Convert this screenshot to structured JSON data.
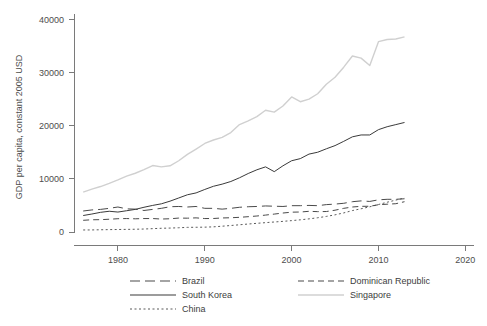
{
  "chart_data": {
    "type": "line",
    "title": "",
    "subtitle": "",
    "xlabel": "",
    "ylabel": "GDP per capita, constant 2005 USD",
    "xlim": [
      1975,
      2021
    ],
    "ylim": [
      0,
      41000
    ],
    "grid": false,
    "legend_position": "bottom",
    "xticks": [
      "1980",
      "1990",
      "2000",
      "2010",
      "2020"
    ],
    "xtick_values": [
      1980,
      1990,
      2000,
      2010,
      2020
    ],
    "yticks": [
      "0",
      "10000",
      "20000",
      "30000",
      "40000"
    ],
    "ytick_values": [
      0,
      10000,
      20000,
      30000,
      40000
    ],
    "x": [
      1976,
      1977,
      1978,
      1979,
      1980,
      1981,
      1982,
      1983,
      1984,
      1985,
      1986,
      1987,
      1988,
      1989,
      1990,
      1991,
      1992,
      1993,
      1994,
      1995,
      1996,
      1997,
      1998,
      1999,
      2000,
      2001,
      2002,
      2003,
      2004,
      2005,
      2006,
      2007,
      2008,
      2009,
      2010,
      2011,
      2012,
      2013
    ],
    "series": [
      {
        "name": "Brazil",
        "color": "#4a4a4a",
        "dash": "long-dash",
        "values": [
          3950,
          4150,
          4250,
          4450,
          4700,
          4350,
          4300,
          4050,
          4250,
          4450,
          4750,
          4800,
          4700,
          4800,
          4450,
          4450,
          4300,
          4450,
          4650,
          4750,
          4800,
          4900,
          4850,
          4800,
          4950,
          4950,
          5000,
          4950,
          5150,
          5250,
          5400,
          5700,
          5850,
          5750,
          6050,
          6150,
          6150,
          6250
        ]
      },
      {
        "name": "South Korea",
        "color": "#3a3a3a",
        "dash": "solid",
        "values": [
          3100,
          3380,
          3700,
          3900,
          3750,
          4000,
          4250,
          4650,
          5000,
          5300,
          5800,
          6400,
          7000,
          7350,
          8000,
          8600,
          9000,
          9500,
          10200,
          11000,
          11700,
          12250,
          11350,
          12450,
          13400,
          13800,
          14650,
          15000,
          15650,
          16250,
          17050,
          17900,
          18250,
          18250,
          19250,
          19800,
          20200,
          20600
        ]
      },
      {
        "name": "China",
        "color": "#5a5a5a",
        "dash": "dotted",
        "values": [
          380,
          390,
          420,
          450,
          470,
          490,
          520,
          560,
          630,
          700,
          740,
          800,
          870,
          890,
          910,
          970,
          1090,
          1220,
          1360,
          1500,
          1630,
          1760,
          1880,
          2000,
          2140,
          2290,
          2470,
          2680,
          2930,
          3230,
          3590,
          4030,
          4370,
          4740,
          5170,
          5600,
          6000,
          6400
        ]
      },
      {
        "name": "Dominican Republic",
        "color": "#4a4a4a",
        "dash": "dash",
        "values": [
          2200,
          2300,
          2320,
          2400,
          2500,
          2530,
          2480,
          2530,
          2530,
          2440,
          2490,
          2620,
          2600,
          2660,
          2530,
          2540,
          2640,
          2680,
          2760,
          2880,
          3010,
          3180,
          3370,
          3570,
          3730,
          3760,
          3890,
          3830,
          3850,
          4100,
          4450,
          4700,
          4830,
          4840,
          5130,
          5230,
          5320,
          5700
        ]
      },
      {
        "name": "Singapore",
        "color": "#d0d0d0",
        "dash": "solid",
        "values": [
          7500,
          8050,
          8550,
          9150,
          9800,
          10500,
          11050,
          11750,
          12500,
          12250,
          12450,
          13400,
          14600,
          15600,
          16650,
          17300,
          17800,
          18700,
          20200,
          20900,
          21700,
          22900,
          22550,
          23700,
          25400,
          24500,
          25000,
          26000,
          27800,
          29100,
          31000,
          33100,
          32700,
          31300,
          35800,
          36200,
          36300,
          36700
        ]
      }
    ]
  },
  "axes": {
    "ylabel": "GDP per capita, constant 2005 USD"
  },
  "legend": {
    "items": [
      {
        "label": "Brazil",
        "style": "long-dash",
        "color": "#4a4a4a"
      },
      {
        "label": "Dominican Republic",
        "style": "dash",
        "color": "#4a4a4a"
      },
      {
        "label": "South Korea",
        "style": "solid",
        "color": "#3a3a3a"
      },
      {
        "label": "Singapore",
        "style": "solid",
        "color": "#d0d0d0"
      },
      {
        "label": "China",
        "style": "dotted",
        "color": "#5a5a5a"
      }
    ]
  }
}
